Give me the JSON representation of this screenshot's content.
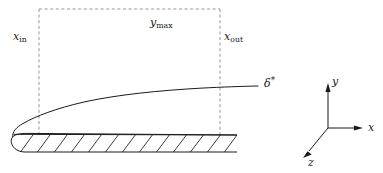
{
  "figure": {
    "background_color": "#ffffff",
    "line_color": "#1a1a1a",
    "dashed_color": "#808080",
    "width": 383,
    "height": 173
  },
  "labels": {
    "x_in": {
      "base": "x",
      "sub": "in"
    },
    "x_out": {
      "base": "x",
      "sub": "out"
    },
    "y_max": {
      "base": "y",
      "sub": "max"
    },
    "delta_star": {
      "base": "δ",
      "sup": "*"
    }
  },
  "axes_triad": {
    "y_axis_label": "y",
    "x_axis_label": "x",
    "z_axis_label": "z",
    "origin": {
      "x": 328,
      "y": 128
    },
    "y_tip": {
      "x": 328,
      "y": 84
    },
    "x_tip": {
      "x": 362,
      "y": 128
    },
    "z_tip": {
      "x": 303,
      "y": 157
    }
  },
  "domain_box": {
    "left": 39,
    "right": 220,
    "top": 9,
    "bottom": 134,
    "style": "dashed"
  },
  "plate": {
    "leading_edge_x": 13,
    "trailing_edge_x": 237,
    "top_y_at_leading_edge": 134,
    "top_y_at_trailing_edge": 135,
    "bottom_y": 152,
    "hatch_count": 13,
    "hatch_direction": "up-right"
  },
  "boundary_layer_curve": {
    "description": "displacement thickness growth along the plate",
    "start": {
      "x": 13,
      "y": 134
    },
    "end": {
      "x": 258,
      "y": 86
    },
    "shape": "square-root"
  }
}
